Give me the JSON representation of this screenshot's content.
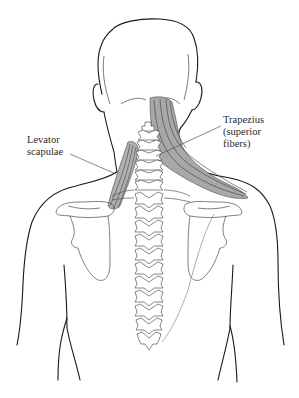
{
  "figure": {
    "view": "posterior neck and shoulders",
    "labels": {
      "levator": {
        "line1": "Levator",
        "line2": "scapulae"
      },
      "trapezius": {
        "line1": "Trapezius",
        "line2": "(superior",
        "line3": "fibers)"
      }
    },
    "colors": {
      "outline": "#1a1a1a",
      "bone": "#555555",
      "muscle_fill": "#a8a8a8",
      "muscle_line": "#4a4a4a",
      "leader": "#555555",
      "background": "#ffffff"
    }
  }
}
